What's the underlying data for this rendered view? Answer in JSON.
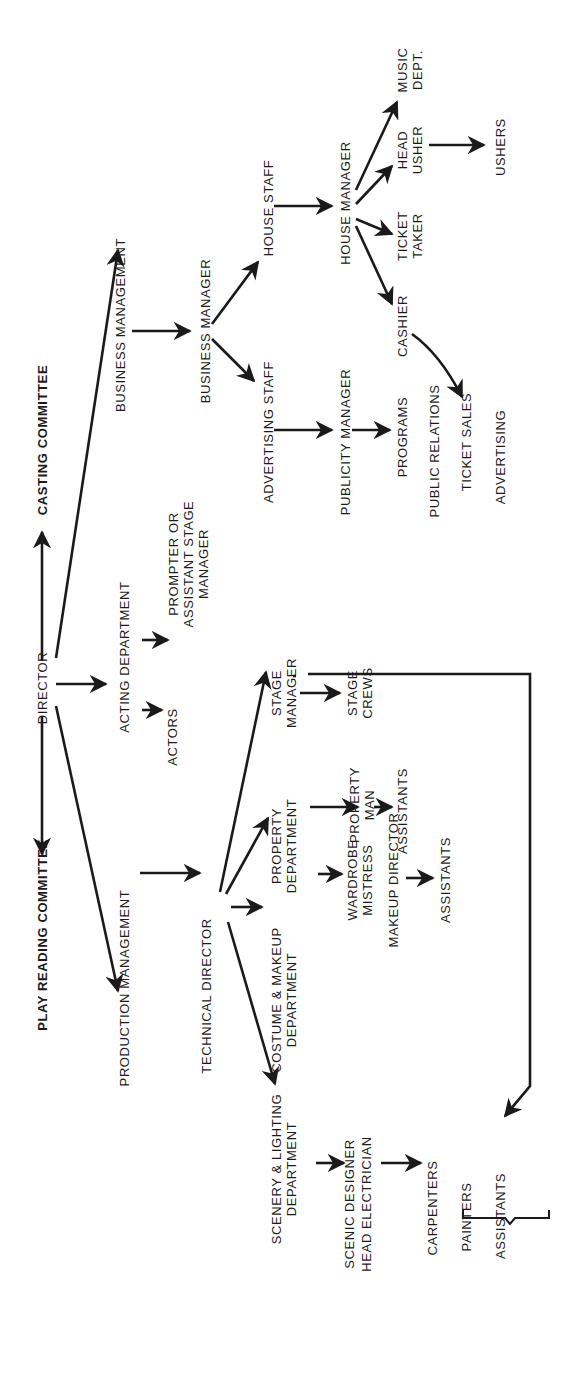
{
  "nodes": {
    "play_reading": "PLAY READING COMMITTEE",
    "director": "DIRECTOR",
    "casting": "CASTING COMMITTEE",
    "business_management": "BUSINESS MANAGEMENT",
    "acting_department": "ACTING DEPARTMENT",
    "production_management": "PRODUCTION MANAGEMENT",
    "business_manager": "BUSINESS MANAGER",
    "prompter": [
      "PROMPTER OR",
      "ASSISTANT STAGE",
      "MANAGER"
    ],
    "actors": "ACTORS",
    "technical_director": "TECHNICAL DIRECTOR",
    "house_staff": "HOUSE STAFF",
    "advertising_staff": "ADVERTISING STAFF",
    "stage_manager": [
      "STAGE",
      "MANAGER"
    ],
    "property_department": [
      "PROPERTY",
      "DEPARTMENT"
    ],
    "costume_makeup_department": [
      "COSTUME & MAKEUP",
      "DEPARTMENT"
    ],
    "scenery_lighting_department": [
      "SCENERY & LIGHTING",
      "DEPARTMENT"
    ],
    "house_manager": "HOUSE MANAGER",
    "publicity_manager": "PUBLICITY MANAGER",
    "stage_crews": [
      "STAGE",
      "CREWS"
    ],
    "property_man": [
      "PROPERTY",
      "MAN"
    ],
    "wardrobe_mistress": [
      "WARDROBE",
      "MISTRESS"
    ],
    "scenic_designer": "SCENIC DESIGNER",
    "head_electrician": "HEAD ELECTRICIAN",
    "makeup_director": "MAKEUP DIRECTOR",
    "cashier": "CASHIER",
    "ticket_taker": [
      "TICKET",
      "TAKER"
    ],
    "head_usher": [
      "HEAD",
      "USHER"
    ],
    "music_dept": [
      "MUSIC",
      "DEPT."
    ],
    "programs": "PROGRAMS",
    "public_relations": "PUBLIC RELATIONS",
    "ticket_sales": "TICKET SALES",
    "advertising": "ADVERTISING",
    "ushers": "USHERS",
    "property_assistants": "ASSISTANTS",
    "makeup_assistants": "ASSISTANTS",
    "carpenters": "CARPENTERS",
    "painters": "PAINTERS",
    "crew_assistants": "ASSISTANTS"
  },
  "edges": [
    [
      "director",
      "play_reading"
    ],
    [
      "director",
      "casting"
    ],
    [
      "director",
      "business_management"
    ],
    [
      "director",
      "acting_department"
    ],
    [
      "director",
      "production_management"
    ],
    [
      "acting_department",
      "prompter"
    ],
    [
      "acting_department",
      "actors"
    ],
    [
      "business_management",
      "business_manager"
    ],
    [
      "business_manager",
      "house_staff"
    ],
    [
      "business_manager",
      "advertising_staff"
    ],
    [
      "house_staff",
      "house_manager"
    ],
    [
      "house_manager",
      "music_dept"
    ],
    [
      "house_manager",
      "head_usher"
    ],
    [
      "house_manager",
      "ticket_taker"
    ],
    [
      "house_manager",
      "cashier"
    ],
    [
      "head_usher",
      "ushers"
    ],
    [
      "cashier",
      "ticket_sales"
    ],
    [
      "advertising_staff",
      "publicity_manager"
    ],
    [
      "publicity_manager",
      "programs"
    ],
    [
      "production_management",
      "technical_director"
    ],
    [
      "technical_director",
      "stage_manager"
    ],
    [
      "technical_director",
      "property_department"
    ],
    [
      "technical_director",
      "costume_makeup_department"
    ],
    [
      "technical_director",
      "scenery_lighting_department"
    ],
    [
      "stage_manager",
      "stage_crews"
    ],
    [
      "stage_manager",
      "carpenters_painters_assistants"
    ],
    [
      "property_department",
      "property_man"
    ],
    [
      "property_man",
      "property_assistants"
    ],
    [
      "costume_makeup_department",
      "wardrobe_mistress"
    ],
    [
      "makeup_director",
      "makeup_assistants"
    ],
    [
      "scenery_lighting_department",
      "scenic_designer"
    ],
    [
      "scenic_designer",
      "carpenters"
    ]
  ],
  "colors": {
    "ink": "#1a1a1a",
    "background": "#ffffff"
  }
}
